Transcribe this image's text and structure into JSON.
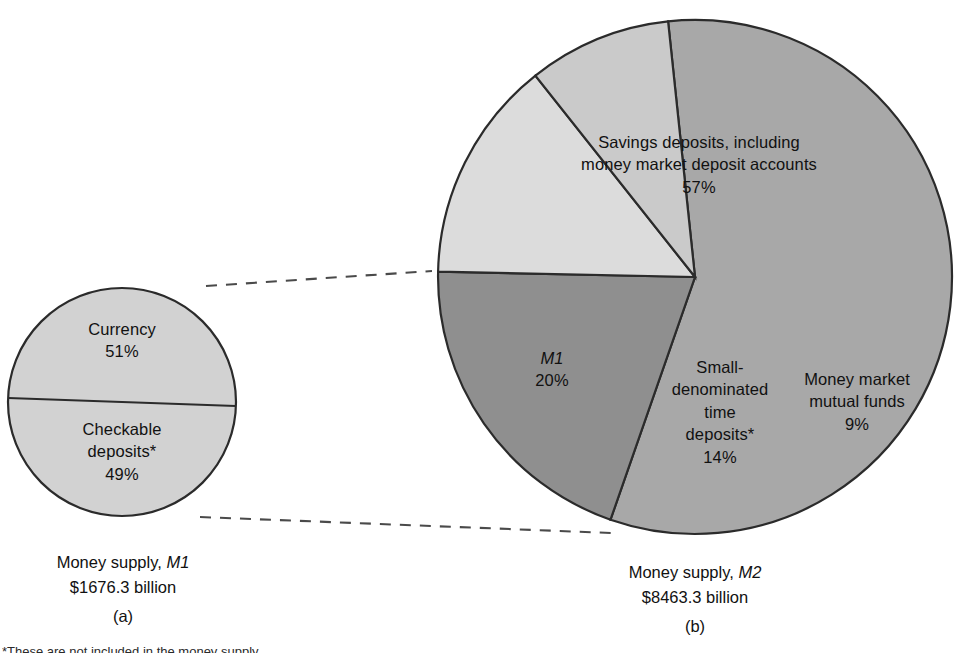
{
  "chart_data": [
    {
      "type": "pie",
      "id": "m1",
      "title": "Money supply, M1",
      "subtitle": "$1676.3 billion",
      "panel": "(a)",
      "categories": [
        "Currency",
        "Checkable deposits*"
      ],
      "values": [
        51,
        49
      ],
      "value_labels": [
        "51%",
        "49%"
      ],
      "colors": [
        "#d2d2d2",
        "#d2d2d2"
      ],
      "legend": "none",
      "grid": false,
      "xlabel": "",
      "ylabel": ""
    },
    {
      "type": "pie",
      "id": "m2",
      "title": "Money supply, M2",
      "subtitle": "$8463.3 billion",
      "panel": "(b)",
      "categories": [
        "Savings deposits, including money market deposit accounts",
        "M1",
        "Small-denominated time deposits*",
        "Money market mutual funds"
      ],
      "values": [
        57,
        20,
        14,
        9
      ],
      "value_labels": [
        "57%",
        "20%",
        "14%",
        "9%"
      ],
      "colors": [
        "#a8a8a8",
        "#8f8f8f",
        "#dcdcdc",
        "#cacaca"
      ],
      "legend": "none",
      "grid": false,
      "xlabel": "",
      "ylabel": ""
    }
  ],
  "m1_chart": {
    "slice_currency": {
      "name": "Currency",
      "pct": "51%"
    },
    "slice_checkable": {
      "line1": "Checkable",
      "line2": "deposits",
      "star": "*",
      "pct": "49%"
    },
    "caption_title_prefix": "Money supply, ",
    "caption_title_ital": "M1",
    "caption_amount": "$1676.3 billion",
    "panel_letter": "(a)"
  },
  "m2_chart": {
    "slice_savings": {
      "line1": "Savings deposits, including",
      "line2": "money market deposit accounts",
      "pct": "57%"
    },
    "slice_m1": {
      "name": "M1",
      "pct": "20%"
    },
    "slice_small_time": {
      "line1": "Small-",
      "line2": "denominated",
      "line3": "time",
      "line4": "deposits",
      "star": "*",
      "pct": "14%"
    },
    "slice_mmmf": {
      "line1": "Money market",
      "line2": "mutual funds",
      "pct": "9%"
    },
    "caption_title_prefix": "Money supply, ",
    "caption_title_ital": "M2",
    "caption_amount": "$8463.3 billion",
    "panel_letter": "(b)"
  },
  "footnote": {
    "text": "*These are not included in the money supply"
  },
  "colors": {
    "m1_pie_fill": "#d2d2d2",
    "m2_savings_fill": "#a8a8a8",
    "m2_m1_fill": "#8f8f8f",
    "m2_small_time_fill": "#dcdcdc",
    "m2_mmmf_fill": "#cacaca",
    "outline": "#2b2b2b",
    "leader": "#4a4a4a"
  }
}
